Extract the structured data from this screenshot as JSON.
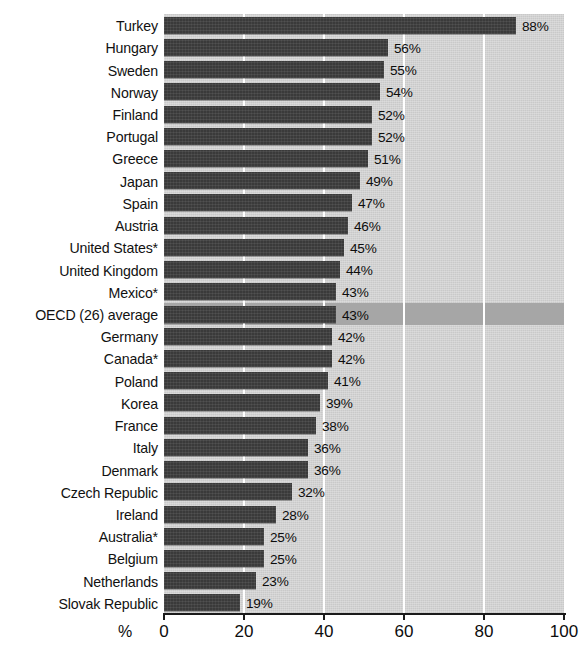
{
  "chart_data": {
    "type": "bar",
    "orientation": "horizontal",
    "title": "",
    "xlabel": "%",
    "ylabel": "",
    "xlim": [
      0,
      100
    ],
    "xticks": [
      0,
      20,
      40,
      60,
      80,
      100
    ],
    "xtick_labels": [
      "0",
      "20",
      "40",
      "60",
      "80",
      "100"
    ],
    "grid": "vertical-white-gridlines-at-20-40-60-80",
    "legend": "none",
    "bar_color": "#3a3a3a",
    "plot_background": "#c9c9c9",
    "highlight_row_color": "#a6a6a6",
    "highlight_row": "OECD (26) average",
    "value_label_suffix": "%",
    "categories": [
      "Turkey",
      "Hungary",
      "Sweden",
      "Norway",
      "Finland",
      "Portugal",
      "Greece",
      "Japan",
      "Spain",
      "Austria",
      "United States*",
      "United Kingdom",
      "Mexico*",
      "OECD (26) average",
      "Germany",
      "Canada*",
      "Poland",
      "Korea",
      "France",
      "Italy",
      "Denmark",
      "Czech Republic",
      "Ireland",
      "Australia*",
      "Belgium",
      "Netherlands",
      "Slovak Republic"
    ],
    "values": [
      88,
      56,
      55,
      54,
      52,
      52,
      51,
      49,
      47,
      46,
      45,
      44,
      43,
      43,
      42,
      42,
      41,
      39,
      38,
      36,
      36,
      32,
      28,
      25,
      25,
      23,
      19
    ],
    "value_labels": [
      "88%",
      "56%",
      "55%",
      "54%",
      "52%",
      "52%",
      "51%",
      "49%",
      "47%",
      "46%",
      "45%",
      "44%",
      "43%",
      "43%",
      "42%",
      "42%",
      "41%",
      "39%",
      "38%",
      "36%",
      "36%",
      "32%",
      "28%",
      "25%",
      "25%",
      "23%",
      "19%"
    ]
  }
}
